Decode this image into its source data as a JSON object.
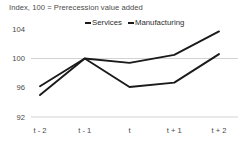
{
  "chart_data": {
    "type": "line",
    "title": "Index, 100 = Prerecession value added",
    "xlabel": "",
    "ylabel": "",
    "categories": [
      "t - 2",
      "t - 1",
      "t",
      "t + 1",
      "t + 2"
    ],
    "series": [
      {
        "name": "Services",
        "values": [
          96.2,
          100.0,
          99.4,
          100.5,
          103.7
        ],
        "color": "#1a1a1a"
      },
      {
        "name": "Manufacturing",
        "values": [
          95.0,
          100.0,
          96.1,
          96.7,
          100.6
        ],
        "color": "#1a1a1a"
      }
    ],
    "ylim": [
      92,
      105.2
    ],
    "yticks": [
      104,
      100,
      96,
      92
    ],
    "ytick_labels": [
      "104",
      "100",
      "96",
      "92"
    ],
    "grid": "horizontal",
    "gridlines_at": [
      100,
      92
    ],
    "legend_position": "top-center",
    "legend_entries": [
      "Services",
      "Manufacturing"
    ],
    "axis_color": "#c8c8c8",
    "text_color": "#4a4a4a",
    "background": "#ffffff"
  },
  "legend": {
    "services_label": "Services",
    "manufacturing_label": "Manufacturing"
  }
}
